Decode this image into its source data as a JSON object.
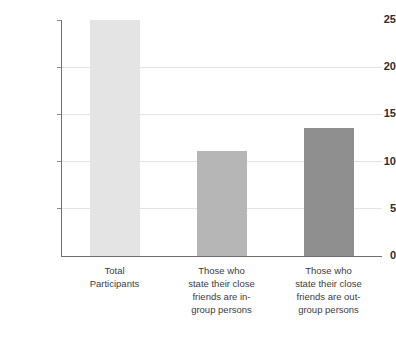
{
  "chart_data": {
    "type": "bar",
    "title": "",
    "subtitle": "",
    "xlabel": "",
    "ylabel": "",
    "ylim": [
      0,
      25
    ],
    "yticks": [
      0,
      5,
      10,
      15,
      20,
      25
    ],
    "ytick_labels": [
      "0",
      "5",
      "10",
      "15",
      "20",
      "25"
    ],
    "grid": true,
    "legend": false,
    "categories": [
      "Total Participants",
      "Those who state their close friends are in-group persons",
      "Those who state their close friends are out-group persons"
    ],
    "category_lines": [
      [
        "Total",
        "Participants"
      ],
      [
        "Those who",
        "state their close",
        "friends are in-",
        "group persons"
      ],
      [
        "Those who",
        "state their close",
        "friends are out-",
        "group persons"
      ]
    ],
    "values": [
      25,
      11.1,
      13.6
    ],
    "bar_colors": [
      "#e4e4e4",
      "#b6b6b6",
      "#8f8f8f"
    ],
    "axis_color": "#6f6f6f",
    "grid_color": "#e3e3e3",
    "background": "#ffffff"
  }
}
